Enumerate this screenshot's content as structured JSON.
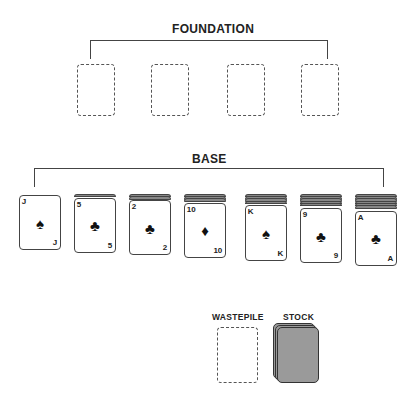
{
  "foundation": {
    "label": "FOUNDATION",
    "slots": 4
  },
  "base": {
    "label": "BASE",
    "piles": [
      {
        "rank": "J",
        "suit": "♠",
        "suit_name": "spades",
        "hidden_count": 0
      },
      {
        "rank": "5",
        "suit": "♣",
        "suit_name": "clubs",
        "hidden_count": 1
      },
      {
        "rank": "2",
        "suit": "♣",
        "suit_name": "clubs",
        "hidden_count": 2
      },
      {
        "rank": "10",
        "suit": "♦",
        "suit_name": "diamonds",
        "hidden_count": 3
      },
      {
        "rank": "K",
        "suit": "♠",
        "suit_name": "spades",
        "hidden_count": 4
      },
      {
        "rank": "9",
        "suit": "♣",
        "suit_name": "clubs",
        "hidden_count": 5
      },
      {
        "rank": "A",
        "suit": "♣",
        "suit_name": "clubs",
        "hidden_count": 6
      }
    ]
  },
  "wastepile": {
    "label": "WASTEPILE"
  },
  "stock": {
    "label": "STOCK"
  },
  "colors": {
    "stroke": "#444444",
    "card_back": "#999999",
    "text": "#222222"
  }
}
